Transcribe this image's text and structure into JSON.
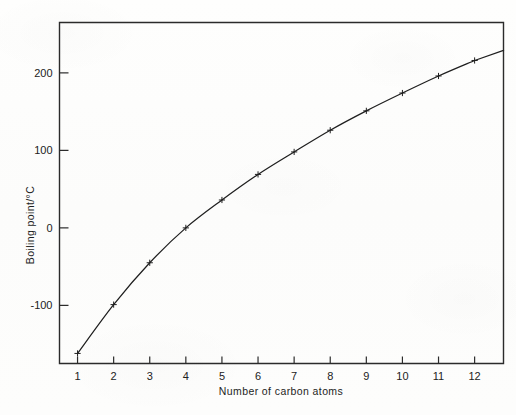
{
  "chart_data": {
    "type": "line",
    "title": "",
    "xlabel": "Number of carbon atoms",
    "ylabel": "Boiling point/°C",
    "x": [
      1,
      2,
      3,
      4,
      5,
      6,
      7,
      8,
      9,
      10,
      11,
      12
    ],
    "values": [
      -162,
      -99,
      -45,
      0,
      36,
      69,
      98,
      126,
      151,
      174,
      196,
      216
    ],
    "xlim": [
      0.5,
      12.8
    ],
    "ylim": [
      -175,
      265
    ],
    "xticks": [
      1,
      2,
      3,
      4,
      5,
      6,
      7,
      8,
      9,
      10,
      11,
      12
    ],
    "xtick_labels": [
      "1",
      "2",
      "3",
      "4",
      "5",
      "6",
      "7",
      "8",
      "9",
      "10",
      "11",
      "12"
    ],
    "yticks": [
      -100,
      0,
      100,
      200
    ],
    "ytick_labels": [
      "-100",
      "0",
      "100",
      "200"
    ],
    "grid": false,
    "legend": false,
    "marker": "cross",
    "line_color": "#1f1f1f",
    "frame_color": "#2b2b2b",
    "background_color": "#fdfdfc"
  },
  "axes": {
    "x_title": "Number of carbon atoms",
    "y_title": "Boiling point/°C"
  }
}
